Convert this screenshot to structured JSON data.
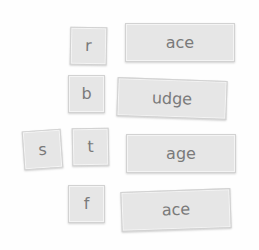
{
  "game": {
    "type": "word-building tiles",
    "letter_tiles": [
      {
        "id": "r",
        "label": "r"
      },
      {
        "id": "b",
        "label": "b"
      },
      {
        "id": "s",
        "label": "s"
      },
      {
        "id": "t",
        "label": "t"
      },
      {
        "id": "f",
        "label": "f"
      }
    ],
    "ending_tiles": [
      {
        "id": "ace1",
        "label": "ace"
      },
      {
        "id": "udge",
        "label": "udge"
      },
      {
        "id": "age",
        "label": "age"
      },
      {
        "id": "ace2",
        "label": "ace"
      }
    ]
  },
  "colors": {
    "tile_fill": "#e6e6e6",
    "tile_border": "#d2d2d2",
    "tile_text": "#7a7a7a",
    "background": "#fefefe"
  }
}
